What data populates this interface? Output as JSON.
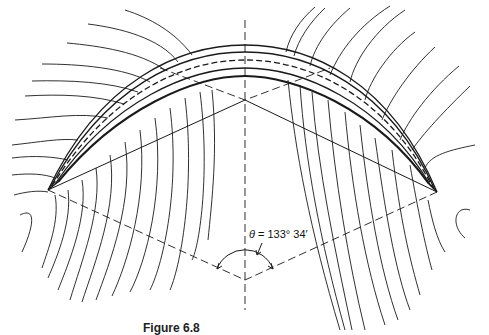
{
  "figure": {
    "angle_label": {
      "symbol": "θ",
      "text": " = 133° 34′"
    },
    "caption": "Figure 6.8",
    "line_color": "#1a1a1a",
    "background": "#ffffff"
  }
}
